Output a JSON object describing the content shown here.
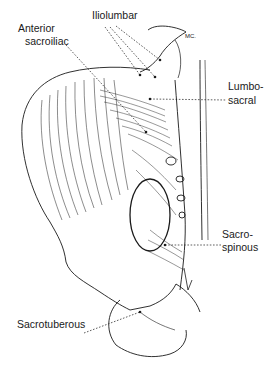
{
  "figure": {
    "labels": {
      "iliolumbar": "Iliolumbar",
      "anterior_sacroiliac_1": "Anterior",
      "anterior_sacroiliac_2": "sacroiliac",
      "lumbosacral_1": "Lumbo-",
      "lumbosacral_2": "sacral",
      "sacrospinous_1": "Sacro-",
      "sacrospinous_2": "spinous",
      "sacrotuberous": "Sacrotuberous",
      "mc": "MC."
    },
    "colors": {
      "ink": "#1a1a1a",
      "background": "#ffffff"
    }
  }
}
